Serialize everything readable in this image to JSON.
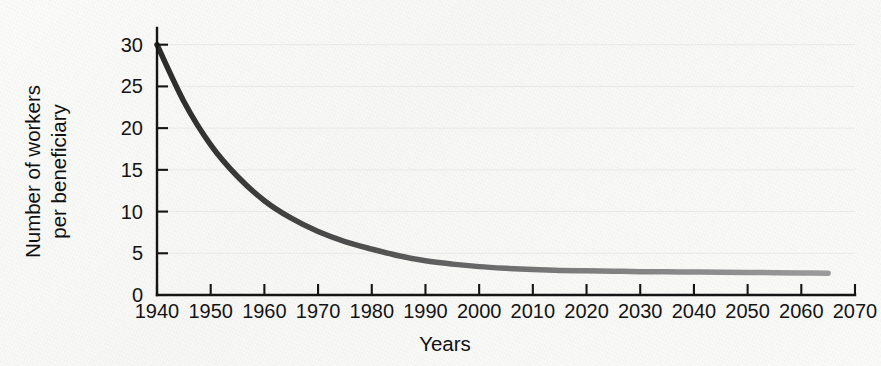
{
  "chart_data": {
    "type": "line",
    "title": "",
    "xlabel": "Years",
    "ylabel": "Number of workers per beneficiary",
    "ylabel_lines": [
      "Number of workers",
      "per beneficiary"
    ],
    "xlim": [
      1940,
      2070
    ],
    "ylim": [
      0,
      32
    ],
    "grid": true,
    "grid_axis": "y",
    "legend": "none",
    "xticks": [
      1940,
      1950,
      1960,
      1970,
      1980,
      1990,
      2000,
      2010,
      2020,
      2030,
      2040,
      2050,
      2060,
      2070
    ],
    "xtick_labels": [
      "1940",
      "1950",
      "1960",
      "1970",
      "1980",
      "1990",
      "2000",
      "2010",
      "2020",
      "2030",
      "2040",
      "2050",
      "2060",
      "2070"
    ],
    "yticks": [
      0,
      5,
      10,
      15,
      20,
      25,
      30
    ],
    "ytick_labels": [
      "0",
      "5",
      "10",
      "15",
      "20",
      "25",
      "30"
    ],
    "series": [
      {
        "name": "Workers per beneficiary",
        "color": "#3a3a3a",
        "line_width": 5.5,
        "x": [
          1940,
          1945,
          1950,
          1955,
          1960,
          1965,
          1970,
          1975,
          1980,
          1985,
          1990,
          1995,
          2000,
          2005,
          2010,
          2015,
          2020,
          2025,
          2030,
          2035,
          2040,
          2045,
          2050,
          2055,
          2060,
          2065
        ],
        "values": [
          30.0,
          23.2,
          18.0,
          14.2,
          11.3,
          9.2,
          7.6,
          6.4,
          5.5,
          4.7,
          4.1,
          3.7,
          3.4,
          3.2,
          3.05,
          2.95,
          2.9,
          2.85,
          2.8,
          2.78,
          2.75,
          2.72,
          2.7,
          2.68,
          2.65,
          2.6
        ]
      }
    ]
  },
  "axes": {
    "x_axis_name": "years-axis",
    "y_axis_name": "workers-per-beneficiary-axis"
  }
}
